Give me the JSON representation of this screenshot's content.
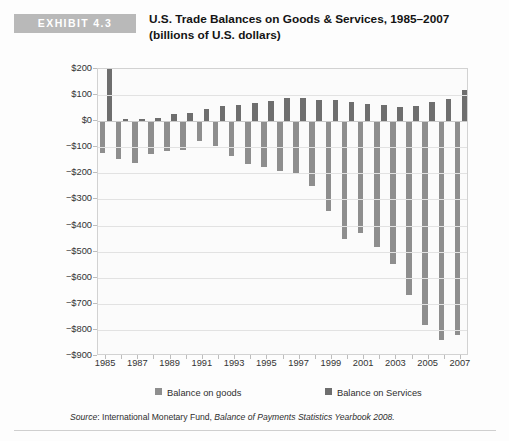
{
  "header": {
    "badge": "EXHIBIT 4.3",
    "title_line1": "U.S. Trade Balances on Goods & Services, 1985–2007",
    "title_line2": "(billions of U.S. dollars)"
  },
  "source": {
    "label": "Source",
    "separator": ": ",
    "body": "International Monetary Fund, ",
    "title": "Balance of Payments Statistics Yearbook 2008."
  },
  "legend": {
    "items": [
      {
        "label": "Balance on goods",
        "color": "#8e8e8e"
      },
      {
        "label": "Balance on Services",
        "color": "#6e6e6e"
      }
    ]
  },
  "colors": {
    "goods": "#8e8e8e",
    "services": "#6e6e6e",
    "badge": "#b9b9b9",
    "grid": "#e2e2e2",
    "plot_background": "#fbfbfb"
  },
  "chart_data": {
    "type": "bar",
    "title": "U.S. Trade Balances on Goods & Services, 1985–2007",
    "subtitle": "(billions of U.S. dollars)",
    "xlabel": "",
    "ylabel": "",
    "ylim": [
      -900,
      200
    ],
    "ytick_values": [
      200,
      100,
      0,
      -100,
      -200,
      -300,
      -400,
      -500,
      -600,
      -700,
      -800,
      -900
    ],
    "ytick_labels": [
      "$200",
      "$100",
      "$0",
      "−$100",
      "−$200",
      "−$300",
      "−$400",
      "−$500",
      "−$600",
      "−$700",
      "−$800",
      "−$900"
    ],
    "grid": true,
    "legend_position": "bottom",
    "categories": [
      1985,
      1986,
      1987,
      1988,
      1989,
      1990,
      1991,
      1992,
      1993,
      1994,
      1995,
      1996,
      1997,
      1998,
      1999,
      2000,
      2001,
      2002,
      2003,
      2004,
      2005,
      2006,
      2007
    ],
    "xtick_labels": [
      "1985",
      "",
      "1987",
      "",
      "1989",
      "",
      "1991",
      "",
      "1993",
      "",
      "1995",
      "",
      "1997",
      "",
      "1999",
      "",
      "2001",
      "",
      "2003",
      "",
      "2005",
      "",
      "2007"
    ],
    "series": [
      {
        "name": "Balance on goods",
        "color": "#8e8e8e",
        "values": [
          -122,
          -145,
          -160,
          -127,
          -116,
          -111,
          -77,
          -97,
          -133,
          -166,
          -174,
          -191,
          -198,
          -247,
          -346,
          -452,
          -427,
          -482,
          -547,
          -665,
          -783,
          -838,
          -819
        ]
      },
      {
        "name": "Balance on Services",
        "color": "#6e6e6e",
        "values": [
          294,
          10,
          8,
          14,
          26,
          31,
          46,
          58,
          63,
          68,
          78,
          89,
          90,
          83,
          82,
          75,
          65,
          62,
          55,
          58,
          72,
          85,
          120
        ]
      }
    ]
  }
}
